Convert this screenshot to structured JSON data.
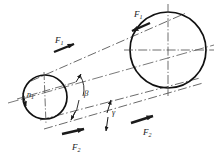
{
  "figure": {
    "type": "engineering-line-drawing",
    "background_color": "#ffffff",
    "line_color": "#1a1a1a",
    "centerline_color": "#555555",
    "belt_color": "#666666"
  },
  "pulleys": [
    {
      "id": "small-pulley",
      "name": "driving-pulley",
      "cx": 45,
      "cy": 97,
      "r": 22,
      "label": "n",
      "label_sub": "1"
    },
    {
      "id": "large-pulley",
      "name": "driven-pulley",
      "cx": 168,
      "cy": 50,
      "r": 38,
      "label": "",
      "label_sub": ""
    }
  ],
  "force_labels": [
    {
      "id": "f1-upper",
      "base": "F",
      "sub": "1",
      "x": 138,
      "y": 16,
      "arrow_dir": "down-left"
    },
    {
      "id": "f1-lower-left",
      "base": "F",
      "sub": "1",
      "x": 58,
      "y": 44,
      "arrow_dir": "down-right"
    },
    {
      "id": "f2-left",
      "base": "F",
      "sub": "2",
      "x": 78,
      "y": 146,
      "arrow_dir": "right"
    },
    {
      "id": "f2-right",
      "base": "F",
      "sub": "2",
      "x": 148,
      "y": 133,
      "arrow_dir": "up-right"
    }
  ],
  "angle_labels": [
    {
      "id": "beta-angle",
      "symbol": "β",
      "x": 84,
      "y": 95,
      "description": "belt wrap angle at small pulley"
    },
    {
      "id": "gamma-angle",
      "symbol": "γ",
      "x": 111,
      "y": 113,
      "description": "angle between belt strands"
    }
  ],
  "centerlines": {
    "style": "dash-dot",
    "small_pulley_horizontal": true,
    "small_pulley_vertical": true,
    "large_pulley_horizontal": true,
    "large_pulley_vertical": true,
    "axis_line": true
  },
  "belt_strands": [
    {
      "id": "upper-strand",
      "name": "tight-side",
      "style": "dash-dot"
    },
    {
      "id": "lower-strand-a",
      "name": "slack-side-a",
      "style": "dash-dot"
    },
    {
      "id": "lower-strand-b",
      "name": "slack-side-b",
      "style": "dash-dot"
    }
  ]
}
